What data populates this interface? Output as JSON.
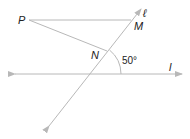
{
  "diagram": {
    "labels": {
      "P": "P",
      "M": "M",
      "N": "N",
      "line_ell": "ℓ",
      "line_l": "l",
      "angle": "50°"
    },
    "colors": {
      "line": "#b8b8b8",
      "text": "#222222",
      "background": "#ffffff"
    }
  }
}
